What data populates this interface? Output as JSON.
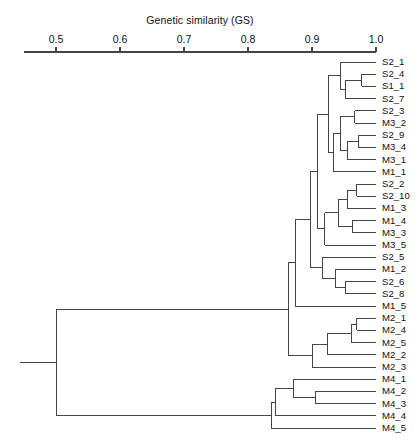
{
  "chart_data": {
    "type": "dendrogram",
    "title": "Genetic similarity (GS)",
    "xlabel": "Genetic similarity (GS)",
    "ylabel": "",
    "axis": {
      "orientation": "top",
      "ticks": [
        0.5,
        0.6,
        0.7,
        0.8,
        0.9,
        1.0
      ],
      "tick_labels": [
        "0.5",
        "0.6",
        "0.7",
        "0.8",
        "0.9",
        "1.0"
      ],
      "xlim": [
        0.4453,
        1.0
      ],
      "direction": "increasing-right",
      "grid": false,
      "legend": null
    },
    "leaves": [
      "S2_1",
      "S2_4",
      "S1_1",
      "S2_7",
      "S2_3",
      "M3_2",
      "S2_9",
      "M3_4",
      "M3_1",
      "M1_1",
      "S2_2",
      "S2_10",
      "M1_3",
      "M1_4",
      "M3_3",
      "M3_5",
      "S2_5",
      "M1_2",
      "S2_6",
      "S2_8",
      "M1_5",
      "M2_1",
      "M2_4",
      "M2_5",
      "M2_2",
      "M2_3",
      "M4_1",
      "M4_2",
      "M4_3",
      "M4_4",
      "M4_5"
    ],
    "line_color": "#444444",
    "merges": [
      {
        "id": "n1",
        "left": "S2_4",
        "right": "S1_1",
        "gs": 0.978
      },
      {
        "id": "n2",
        "left": "n1",
        "right": "S2_7",
        "gs": 0.952
      },
      {
        "id": "n3",
        "left": "S2_1",
        "right": "n2",
        "gs": 0.944
      },
      {
        "id": "n4",
        "left": "S2_3",
        "right": "M3_2",
        "gs": 0.967
      },
      {
        "id": "n5",
        "left": "S2_9",
        "right": "M3_4",
        "gs": 0.972
      },
      {
        "id": "n6",
        "left": "n5",
        "right": "M3_1",
        "gs": 0.956
      },
      {
        "id": "n7",
        "left": "n4",
        "right": "n6",
        "gs": 0.944
      },
      {
        "id": "n8",
        "left": "n7",
        "right": "M1_1",
        "gs": 0.933
      },
      {
        "id": "n9",
        "left": "n3",
        "right": "n8",
        "gs": 0.925
      },
      {
        "id": "n10",
        "left": "S2_2",
        "right": "S2_10",
        "gs": 0.97
      },
      {
        "id": "n11",
        "left": "n10",
        "right": "M1_3",
        "gs": 0.955
      },
      {
        "id": "n12",
        "left": "M1_4",
        "right": "M3_3",
        "gs": 0.963
      },
      {
        "id": "n13",
        "left": "n11",
        "right": "n12",
        "gs": 0.941
      },
      {
        "id": "n14",
        "left": "n13",
        "right": "M3_5",
        "gs": 0.92
      },
      {
        "id": "n15",
        "left": "n9",
        "right": "n14",
        "gs": 0.909
      },
      {
        "id": "n16",
        "left": "S2_6",
        "right": "S2_8",
        "gs": 0.952
      },
      {
        "id": "n17",
        "left": "M1_2",
        "right": "n16",
        "gs": 0.936
      },
      {
        "id": "n18",
        "left": "S2_5",
        "right": "n17",
        "gs": 0.917
      },
      {
        "id": "n19",
        "left": "n15",
        "right": "n18",
        "gs": 0.897
      },
      {
        "id": "n20",
        "left": "n19",
        "right": "M1_5",
        "gs": 0.874
      },
      {
        "id": "n21",
        "left": "M2_1",
        "right": "M2_4",
        "gs": 0.97
      },
      {
        "id": "n22",
        "left": "n21",
        "right": "M2_5",
        "gs": 0.962
      },
      {
        "id": "n23",
        "left": "n22",
        "right": "M2_2",
        "gs": 0.924
      },
      {
        "id": "n24",
        "left": "n23",
        "right": "M2_3",
        "gs": 0.9
      },
      {
        "id": "n25",
        "left": "n20",
        "right": "n24",
        "gs": 0.863
      },
      {
        "id": "n26",
        "left": "M4_2",
        "right": "M4_3",
        "gs": 0.905
      },
      {
        "id": "n27",
        "left": "M4_1",
        "right": "n26",
        "gs": 0.871
      },
      {
        "id": "n28",
        "left": "n27",
        "right": "M4_4",
        "gs": 0.843
      },
      {
        "id": "n29",
        "left": "n28",
        "right": "M4_5",
        "gs": 0.836
      },
      {
        "id": "n30",
        "left": "n25",
        "right": "n29",
        "gs": 0.5
      }
    ]
  },
  "geometry": {
    "plot_left_px": 20,
    "axis_x0_px": 56,
    "axis_x1_px": 376,
    "axis_gs0": 0.5,
    "axis_gs1": 1.0,
    "axis_y_px": 52,
    "first_leaf_y_px": 62,
    "leaf_spacing_px": 12.2,
    "label_offset_px": 6
  }
}
